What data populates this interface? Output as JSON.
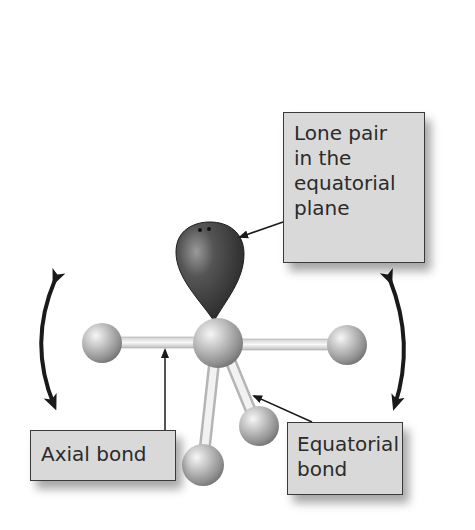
{
  "labels": {
    "lone_pair": {
      "lines": [
        "Lone pair",
        "in the",
        "equatorial",
        "plane"
      ]
    },
    "axial_bond": {
      "lines": [
        "Axial bond"
      ]
    },
    "equatorial_bond": {
      "lines": [
        "Equatorial",
        "bond"
      ]
    }
  },
  "colors": {
    "label_fill": "#d9d9d9",
    "label_border": "#3a3a3a",
    "lone_pair_lobe": "#3c3c3c",
    "atom": "#b8b8b8",
    "bond": "#e4e4e4",
    "arrow": "#1a1a1a"
  },
  "atoms": [
    {
      "id": "central",
      "cx": 218,
      "cy": 343,
      "r": 25
    },
    {
      "id": "axial-left",
      "cx": 102,
      "cy": 343,
      "r": 20
    },
    {
      "id": "axial-right",
      "cx": 347,
      "cy": 345,
      "r": 20
    },
    {
      "id": "equatorial-front",
      "cx": 259,
      "cy": 426,
      "r": 20
    },
    {
      "id": "equatorial-lower",
      "cx": 203,
      "cy": 465,
      "r": 21
    }
  ],
  "motion_arrows": [
    "left-curved-double-arrow",
    "right-curved-double-arrow"
  ]
}
